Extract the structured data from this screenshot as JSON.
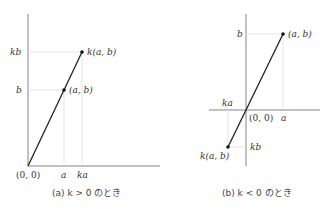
{
  "panel_a": {
    "caption": "(a)  k > 0 のとき",
    "origin_label": "(0, 0)",
    "x_ticks": [
      "a",
      "ka"
    ],
    "y_ticks": [
      "b",
      "kb"
    ],
    "points": [
      {
        "label": "(a, b)"
      },
      {
        "label": "k(a, b)"
      }
    ]
  },
  "panel_b": {
    "caption": "(b)  k < 0 のとき",
    "origin_label": "(0, 0)",
    "x_ticks": [
      "a",
      "ka"
    ],
    "y_ticks": [
      "b",
      "kb"
    ],
    "points": [
      {
        "label": "(a, b)"
      },
      {
        "label": "k(a, b)"
      }
    ]
  }
}
